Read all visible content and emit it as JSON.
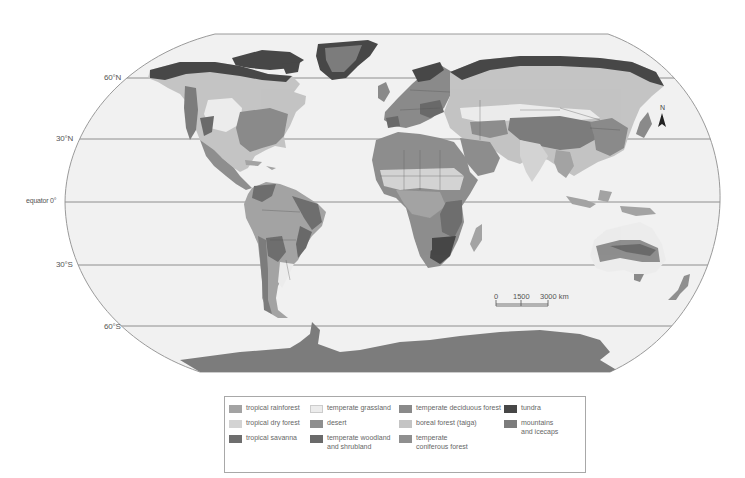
{
  "map": {
    "projection": "world biomes",
    "latitude_labels": {
      "lat60n": "60°N",
      "lat30n": "30°N",
      "equator": "equator  0°",
      "lat30s": "30°S",
      "lat60s": "60°S"
    },
    "north_arrow": {
      "label": "N",
      "icon": "north-arrow-icon"
    },
    "scale_bar": {
      "tick0": "0",
      "tick1": "1500",
      "tick2": "3000 km"
    },
    "colors": {
      "ocean": "#f1f1f1",
      "frame": "#9a9a9a",
      "gridline": "#8e8e8e",
      "border": "#555555"
    }
  },
  "legend": {
    "items": [
      {
        "label": "tropical rainforest",
        "color": "#a3a3a3"
      },
      {
        "label": "tropical dry forest",
        "color": "#d3d3d3"
      },
      {
        "label": "tropical savanna",
        "color": "#6e6e6e"
      },
      {
        "label": "temperate grassland",
        "color": "#ececec"
      },
      {
        "label": "desert",
        "color": "#8e8e8e"
      },
      {
        "label": "temperate woodland\nand shrubland",
        "color": "#6a6a6a"
      },
      {
        "label": "temperate deciduous forest",
        "color": "#8a8a8a"
      },
      {
        "label": "boreal forest (taiga)",
        "color": "#c4c4c4"
      },
      {
        "label": "temperate\nconiferous forest",
        "color": "#8f8f8f"
      },
      {
        "label": "tundra",
        "color": "#474747"
      },
      {
        "label": "mountains\nand icecaps",
        "color": "#7c7c7c"
      }
    ]
  }
}
